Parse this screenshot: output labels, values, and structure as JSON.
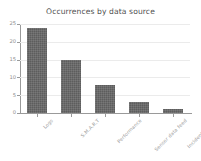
{
  "chart_data": {
    "type": "bar",
    "title": "Occurrences by data source",
    "xlabel": "",
    "ylabel": "",
    "categories": [
      "Logs",
      "S.M.A.R.T",
      "Performance",
      "Sensor data feed",
      "Incident tickets"
    ],
    "values": [
      24,
      15,
      8,
      3,
      1
    ],
    "ylim": [
      0,
      25
    ],
    "yticks": [
      0,
      5,
      10,
      15,
      20,
      25
    ],
    "ytick_labels": [
      "0",
      "5",
      "10",
      "15",
      "20",
      "25"
    ],
    "grid": true,
    "legend": "none",
    "bar_color": "#5d5d5d",
    "gridline_color": "#ebebeb",
    "axis_color": "#9a9a9a",
    "background_color": "#ffffff",
    "title_color": "#4f4f4f",
    "tick_label_color": "#9b9b9b",
    "xtick_rotation": -45
  }
}
